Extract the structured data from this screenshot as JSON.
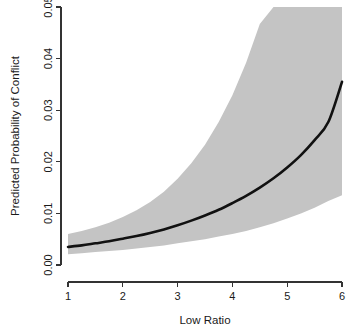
{
  "figure": {
    "title": "",
    "background_color": "#ffffff"
  },
  "axes": {
    "y": {
      "title": "Predicted Probability of Conflict",
      "tick_labels": [
        "0.00",
        "0.01",
        "0.02",
        "0.03",
        "0.04",
        "0.05"
      ],
      "tick_values": [
        0.0,
        0.01,
        0.02,
        0.03,
        0.04,
        0.05
      ],
      "limits": [
        0.0,
        0.05
      ]
    },
    "x": {
      "title": "Low Ratio",
      "tick_labels": [
        "1",
        "2",
        "3",
        "4",
        "5",
        "6"
      ],
      "tick_values": [
        1,
        2,
        3,
        4,
        5,
        6
      ],
      "limits": [
        1,
        6
      ]
    }
  },
  "colors": {
    "line": "#111111",
    "band": "#c4c4c4",
    "axis": "#333333",
    "text": "#1a1a1a"
  },
  "chart_data": {
    "type": "line",
    "title": "",
    "subtitle": "",
    "xlabel": "Low Ratio",
    "ylabel": "Predicted Probability of Conflict",
    "xlim": [
      1,
      6
    ],
    "ylim": [
      0.0,
      0.05
    ],
    "grid": false,
    "legend": "none",
    "xticks": [
      1,
      2,
      3,
      4,
      5,
      6
    ],
    "yticks": [
      0.0,
      0.01,
      0.02,
      0.03,
      0.04,
      0.05
    ],
    "x": [
      1.0,
      1.25,
      1.5,
      1.75,
      2.0,
      2.25,
      2.5,
      2.75,
      3.0,
      3.25,
      3.5,
      3.75,
      4.0,
      4.25,
      4.5,
      4.75,
      5.0,
      5.25,
      5.5,
      5.75,
      6.0
    ],
    "series": [
      {
        "name": "Predicted probability",
        "kind": "line",
        "values": [
          0.0035,
          0.0038,
          0.0042,
          0.0046,
          0.0051,
          0.0056,
          0.0062,
          0.0069,
          0.0077,
          0.0086,
          0.0096,
          0.0107,
          0.012,
          0.0134,
          0.015,
          0.0168,
          0.0189,
          0.0213,
          0.0242,
          0.0277,
          0.0355
        ]
      },
      {
        "name": "Confidence interval upper bound",
        "kind": "band-upper",
        "values": [
          0.006,
          0.0066,
          0.0073,
          0.0082,
          0.0093,
          0.0106,
          0.0122,
          0.0142,
          0.0167,
          0.0197,
          0.0233,
          0.0277,
          0.0329,
          0.0392,
          0.0467,
          0.05,
          0.05,
          0.05,
          0.05,
          0.05,
          0.05
        ]
      },
      {
        "name": "Confidence interval lower bound",
        "kind": "band-lower",
        "values": [
          0.0021,
          0.0023,
          0.0025,
          0.0027,
          0.0029,
          0.0032,
          0.0035,
          0.0038,
          0.0042,
          0.0046,
          0.005,
          0.0055,
          0.006,
          0.0066,
          0.0073,
          0.0081,
          0.009,
          0.01,
          0.0111,
          0.0124,
          0.0135
        ]
      }
    ],
    "annotations": []
  }
}
